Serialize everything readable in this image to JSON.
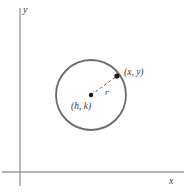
{
  "figure": {
    "background_color": "#ffffff",
    "axes": {
      "x_axis_label": "x",
      "y_axis_label": "y",
      "axis_color": "#9a9a9a",
      "origin_px": [
        20,
        172
      ],
      "x_axis_from_px": [
        2,
        172
      ],
      "x_axis_to_px": [
        184,
        172
      ],
      "y_axis_from_px": [
        20,
        8
      ],
      "y_axis_to_px": [
        20,
        186
      ]
    },
    "circle": {
      "center_px": [
        91,
        95
      ],
      "radius_px": 35,
      "stroke_color": "#6b6b6b",
      "stroke_width": 1.8,
      "fill": "none"
    },
    "radius_line": {
      "label": "r",
      "style": "dashed",
      "stroke_color": "#5a5a5a",
      "from_px": [
        91,
        95
      ],
      "to_px": [
        117,
        76
      ]
    },
    "points": [
      {
        "name": "center",
        "label": "(h, k)",
        "position_px": [
          91,
          95
        ],
        "label_position_px": [
          71,
          102
        ],
        "dot_color": "#1a1a1a",
        "dot_radius": 2.2
      },
      {
        "name": "point-on-circle",
        "label": "(x, y)",
        "position_px": [
          117,
          76
        ],
        "label_position_px": [
          124,
          68
        ],
        "dot_color": "#1a1a1a",
        "dot_radius": 2.6
      }
    ]
  }
}
